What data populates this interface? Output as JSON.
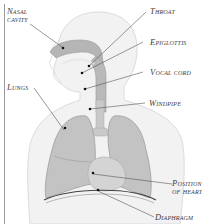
{
  "diagram": {
    "colors": {
      "background": "#ffffff",
      "body_silhouette": "#f1f1f1",
      "body_outline": "#d9d9d9",
      "organ_fill": "#b9b9b9",
      "organ_dark": "#9c9c9c",
      "leader_line": "#555555",
      "label_text": "#3a3a3a"
    },
    "labels": {
      "nasal_cavity_line1": "Nasal",
      "nasal_cavity_line2": "cavity",
      "throat": "Throat",
      "epiglottis": "Epiglottis",
      "vocal_cord": "Vocal cord",
      "windpipe": "Windpipe",
      "lungs": "Lungs",
      "heart_line1": "Position",
      "heart_line2": "of heart",
      "diaphragm": "Diaphragm"
    }
  }
}
